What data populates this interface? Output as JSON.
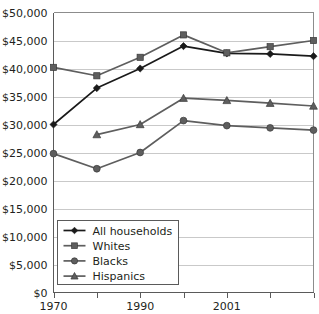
{
  "chart_data": {
    "type": "line",
    "title": "",
    "xlabel": "",
    "ylabel": "",
    "grid": true,
    "legend_position": "bottom-left",
    "ylim": [
      0,
      50000
    ],
    "ytick_labels": [
      "$50,000",
      "$45,000",
      "$40,000",
      "$35,000",
      "$30,000",
      "$25,000",
      "$20,000",
      "$15,000",
      "$10,000",
      "$5,000",
      "$0"
    ],
    "ytick_values": [
      50000,
      45000,
      40000,
      35000,
      30000,
      25000,
      20000,
      15000,
      10000,
      5000,
      0
    ],
    "x": [
      1970,
      1980,
      1990,
      2000,
      2001,
      2002,
      2003
    ],
    "xtick_labels": [
      "1970",
      "",
      "1990",
      "",
      "2001",
      "",
      ""
    ],
    "xtick_labels_visible": [
      {
        "index": 0,
        "label": "1970"
      },
      {
        "index": 2,
        "label": "1990"
      },
      {
        "index": 4,
        "label": "2001"
      }
    ],
    "series": [
      {
        "name": "All households",
        "marker": "diamond",
        "color": "#1a1a1a",
        "values": [
          30000,
          36500,
          40000,
          44000,
          42700,
          42600,
          42200
        ]
      },
      {
        "name": "Whites",
        "marker": "square",
        "color": "#5e5e5e",
        "values": [
          40200,
          38700,
          42000,
          46000,
          42800,
          43900,
          45000
        ]
      },
      {
        "name": "Blacks",
        "marker": "circle",
        "color": "#5e5e5e",
        "values": [
          24800,
          22100,
          25000,
          30700,
          29800,
          29400,
          29000
        ]
      },
      {
        "name": "Hispanics",
        "marker": "triangle",
        "color": "#5e5e5e",
        "values": [
          null,
          28200,
          30000,
          34700,
          34300,
          33800,
          33300
        ]
      }
    ],
    "legend": [
      {
        "label": "All households",
        "marker": "diamond",
        "color": "#1a1a1a"
      },
      {
        "label": "Whites",
        "marker": "square",
        "color": "#5e5e5e"
      },
      {
        "label": "Blacks",
        "marker": "circle",
        "color": "#5e5e5e"
      },
      {
        "label": "Hispanics",
        "marker": "triangle",
        "color": "#5e5e5e"
      }
    ]
  }
}
